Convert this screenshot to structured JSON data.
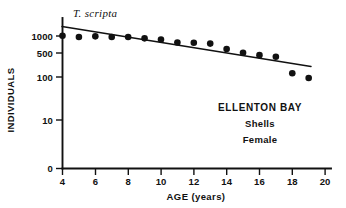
{
  "chart_data": {
    "type": "scatter",
    "title": "T. scripta",
    "xlabel": "AGE (years)",
    "ylabel": "INDIVIDUALS",
    "xlim": [
      4,
      20
    ],
    "ylim": [
      0,
      2000
    ],
    "yscale": "log-with-zero-break",
    "grid": false,
    "legend": "none",
    "xticks": [
      4,
      6,
      8,
      10,
      12,
      14,
      16,
      18,
      20
    ],
    "xtick_labels": [
      "4",
      "6",
      "8",
      "10",
      "12",
      "14",
      "16",
      "18",
      "20"
    ],
    "yticks": [
      0,
      10,
      100,
      500,
      1000
    ],
    "ytick_labels": [
      "0",
      "10",
      "100",
      "500",
      "1000"
    ],
    "series": [
      {
        "name": "Shells, Female",
        "marker": "filled-circle",
        "x": [
          4.0,
          5.0,
          6.0,
          7.0,
          8.0,
          9.0,
          10.0,
          11.0,
          12.0,
          13.0,
          14.0,
          15.0,
          16.0,
          17.0,
          18.0,
          19.0
        ],
        "y": [
          1010,
          950,
          980,
          950,
          950,
          880,
          820,
          700,
          690,
          660,
          490,
          400,
          350,
          320,
          130,
          100
        ]
      }
    ],
    "fit_line": {
      "name": "regression line",
      "x": [
        3.95,
        19.1
      ],
      "y": [
        1450,
        195
      ]
    },
    "annotations": [
      {
        "text": "T. scripta",
        "style": "italic",
        "position": "top-left"
      },
      {
        "text": "ELLENTON BAY",
        "style": "bold",
        "position": "right-middle"
      },
      {
        "text": "Shells",
        "style": "bold",
        "position": "right-middle"
      },
      {
        "text": "Female",
        "style": "bold",
        "position": "right-middle"
      }
    ]
  },
  "axes": {
    "x_title": "AGE (years)",
    "y_title": "INDIVIDUALS",
    "x_ticks": [
      "4",
      "6",
      "8",
      "10",
      "12",
      "14",
      "16",
      "18",
      "20"
    ],
    "y_ticks": [
      "1000",
      "500",
      "100",
      "10",
      "0"
    ]
  },
  "labels": {
    "species": "T. scripta",
    "site": "ELLENTON BAY",
    "material": "Shells",
    "sex": "Female"
  }
}
